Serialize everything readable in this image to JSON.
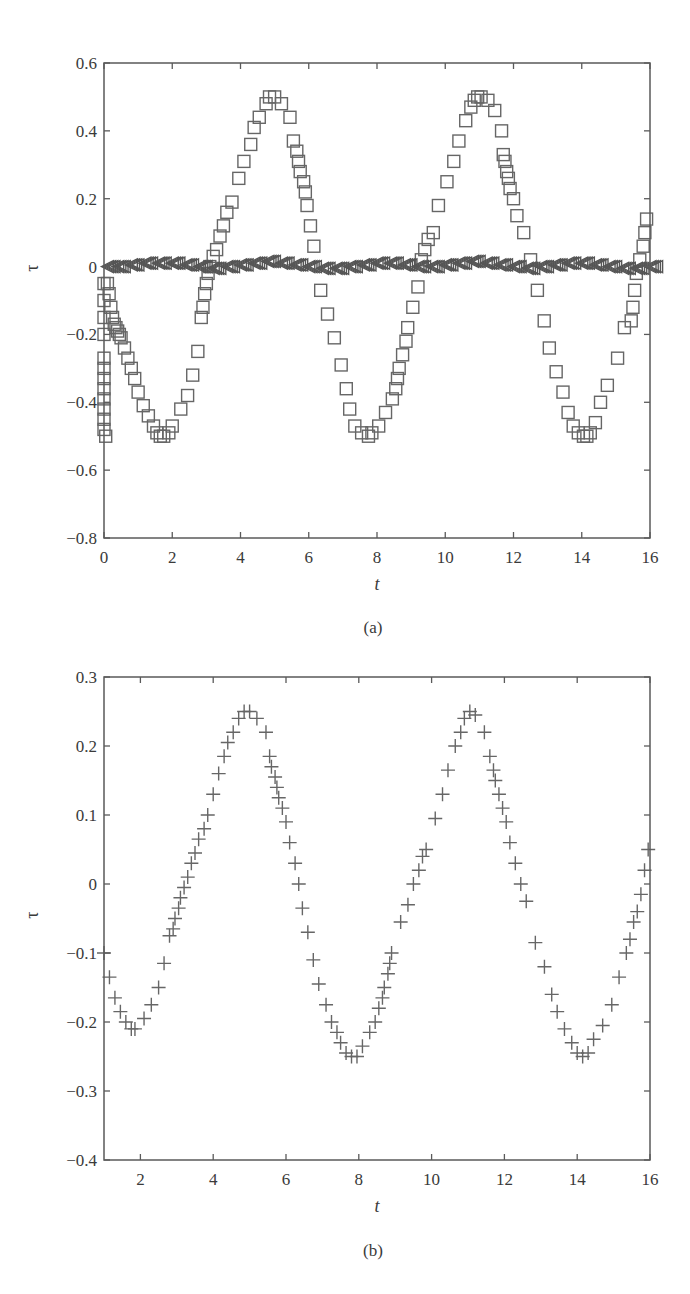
{
  "chart_data": [
    {
      "id": "a",
      "type": "scatter",
      "panel_label": "(a)",
      "title": "",
      "xlabel": "t",
      "ylabel": "τ",
      "xlim": [
        0,
        16
      ],
      "ylim": [
        -0.8,
        0.6
      ],
      "xticks": [
        0,
        2,
        4,
        6,
        8,
        10,
        12,
        14,
        16
      ],
      "xtick_labels": [
        "0",
        "2",
        "4",
        "6",
        "8",
        "10",
        "12",
        "14",
        "16"
      ],
      "yticks": [
        0.6,
        0.4,
        0.2,
        0,
        -0.2,
        -0.4,
        -0.6,
        -0.8
      ],
      "ytick_labels": [
        "0.6",
        "0.4",
        "0.2",
        "0",
        "−0.2",
        "−0.4",
        "−0.6",
        "−0.8"
      ],
      "grid": false,
      "legend": null,
      "series": [
        {
          "name": "squares",
          "marker": "square",
          "x": [
            0.0,
            0.0,
            0.0,
            0.0,
            0.0,
            0.0,
            0.0,
            0.0,
            0.0,
            0.0,
            0.0,
            0.0,
            0.05,
            0.1,
            0.15,
            0.2,
            0.25,
            0.3,
            0.35,
            0.4,
            0.45,
            0.5,
            0.6,
            0.7,
            0.8,
            0.9,
            1.0,
            1.15,
            1.3,
            1.45,
            1.55,
            1.65,
            1.75,
            1.9,
            2.0,
            2.25,
            2.45,
            2.6,
            2.75,
            2.85,
            2.9,
            2.95,
            3.0,
            3.05,
            3.1,
            3.2,
            3.3,
            3.4,
            3.5,
            3.6,
            3.75,
            3.95,
            4.1,
            4.3,
            4.4,
            4.55,
            4.75,
            4.85,
            5.0,
            5.2,
            5.45,
            5.55,
            5.65,
            5.7,
            5.75,
            5.85,
            5.9,
            5.95,
            6.05,
            6.15,
            6.35,
            6.55,
            6.75,
            6.95,
            7.1,
            7.2,
            7.35,
            7.55,
            7.75,
            7.85,
            8.05,
            8.25,
            8.45,
            8.55,
            8.6,
            8.65,
            8.75,
            8.85,
            8.9,
            9.05,
            9.2,
            9.3,
            9.4,
            9.5,
            9.65,
            9.8,
            10.05,
            10.25,
            10.4,
            10.6,
            10.75,
            10.85,
            10.95,
            11.05,
            11.25,
            11.45,
            11.65,
            11.7,
            11.75,
            11.8,
            11.85,
            11.9,
            12.0,
            12.1,
            12.3,
            12.5,
            12.7,
            12.9,
            13.05,
            13.25,
            13.45,
            13.6,
            13.75,
            13.9,
            14.05,
            14.15,
            14.25,
            14.4,
            14.55,
            14.75,
            15.05,
            15.25,
            15.45,
            15.5,
            15.55,
            15.6,
            15.7,
            15.8,
            15.85,
            15.9
          ],
          "y": [
            -0.05,
            -0.1,
            -0.15,
            -0.2,
            -0.27,
            -0.3,
            -0.33,
            -0.36,
            -0.39,
            -0.42,
            -0.45,
            -0.48,
            -0.5,
            -0.05,
            -0.08,
            -0.12,
            -0.15,
            -0.17,
            -0.18,
            -0.19,
            -0.2,
            -0.21,
            -0.24,
            -0.27,
            -0.3,
            -0.33,
            -0.37,
            -0.41,
            -0.44,
            -0.47,
            -0.49,
            -0.5,
            -0.5,
            -0.49,
            -0.47,
            -0.42,
            -0.38,
            -0.32,
            -0.25,
            -0.15,
            -0.12,
            -0.08,
            -0.05,
            -0.02,
            0.0,
            0.03,
            0.05,
            0.09,
            0.12,
            0.16,
            0.19,
            0.26,
            0.31,
            0.36,
            0.41,
            0.44,
            0.48,
            0.5,
            0.5,
            0.48,
            0.44,
            0.37,
            0.34,
            0.31,
            0.28,
            0.25,
            0.22,
            0.18,
            0.12,
            0.06,
            -0.07,
            -0.14,
            -0.21,
            -0.29,
            -0.36,
            -0.42,
            -0.47,
            -0.49,
            -0.5,
            -0.49,
            -0.47,
            -0.43,
            -0.39,
            -0.36,
            -0.33,
            -0.3,
            -0.26,
            -0.22,
            -0.18,
            -0.12,
            -0.06,
            0.02,
            0.05,
            0.08,
            0.1,
            0.18,
            0.25,
            0.31,
            0.37,
            0.43,
            0.47,
            0.49,
            0.5,
            0.5,
            0.49,
            0.46,
            0.4,
            0.33,
            0.31,
            0.28,
            0.26,
            0.23,
            0.2,
            0.15,
            0.1,
            0.02,
            -0.07,
            -0.16,
            -0.24,
            -0.31,
            -0.37,
            -0.43,
            -0.47,
            -0.49,
            -0.5,
            -0.5,
            -0.49,
            -0.46,
            -0.4,
            -0.35,
            -0.27,
            -0.18,
            -0.16,
            -0.12,
            -0.07,
            -0.02,
            0.02,
            0.06,
            0.1,
            0.14
          ]
        },
        {
          "name": "triangles",
          "marker": "triangle-left",
          "description": "dense band of triangle markers oscillating with small amplitude around τ=0 across t=0 to 16",
          "x": [
            0.1,
            0.4,
            0.8,
            1.2,
            1.6,
            2.0,
            2.4,
            2.8,
            3.2,
            3.6,
            4.0,
            4.4,
            4.8,
            5.2,
            5.6,
            6.0,
            6.4,
            6.8,
            7.2,
            7.6,
            8.0,
            8.4,
            8.8,
            9.2,
            9.6,
            10.0,
            10.4,
            10.8,
            11.2,
            11.6,
            12.0,
            12.4,
            12.8,
            13.2,
            13.6,
            14.0,
            14.4,
            14.8,
            15.2,
            15.6,
            16.0
          ],
          "y": [
            0.0,
            0.0,
            0.005,
            0.01,
            0.01,
            0.01,
            0.005,
            0.0,
            -0.005,
            0.0,
            0.005,
            0.01,
            0.015,
            0.01,
            0.005,
            0.0,
            -0.005,
            -0.005,
            0.0,
            0.005,
            0.01,
            0.01,
            0.005,
            0.0,
            0.0,
            0.005,
            0.01,
            0.015,
            0.01,
            0.005,
            0.0,
            -0.005,
            0.0,
            0.005,
            0.01,
            0.01,
            0.005,
            0.0,
            -0.005,
            -0.005,
            0.0
          ]
        }
      ]
    },
    {
      "id": "b",
      "type": "scatter",
      "panel_label": "(b)",
      "title": "",
      "xlabel": "t",
      "ylabel": "τ",
      "xlim": [
        1,
        16
      ],
      "ylim": [
        -0.4,
        0.3
      ],
      "xticks": [
        2,
        4,
        6,
        8,
        10,
        12,
        14,
        16
      ],
      "xtick_labels": [
        "2",
        "4",
        "6",
        "8",
        "10",
        "12",
        "14",
        "16"
      ],
      "yticks": [
        0.3,
        0.2,
        0.1,
        0,
        -0.1,
        -0.2,
        -0.3,
        -0.4
      ],
      "ytick_labels": [
        "0.3",
        "0.2",
        "0.1",
        "0",
        "−0.1",
        "−0.2",
        "−0.3",
        "−0.4"
      ],
      "grid": false,
      "legend": null,
      "series": [
        {
          "name": "plus",
          "marker": "plus",
          "x": [
            1.0,
            1.15,
            1.3,
            1.45,
            1.6,
            1.75,
            1.85,
            2.1,
            2.3,
            2.5,
            2.65,
            2.8,
            2.9,
            2.95,
            3.05,
            3.1,
            3.2,
            3.3,
            3.4,
            3.5,
            3.6,
            3.75,
            3.85,
            4.0,
            4.15,
            4.3,
            4.4,
            4.55,
            4.7,
            4.85,
            5.0,
            5.2,
            5.45,
            5.55,
            5.6,
            5.7,
            5.75,
            5.8,
            5.9,
            6.0,
            6.1,
            6.25,
            6.35,
            6.45,
            6.6,
            6.75,
            6.9,
            7.1,
            7.25,
            7.4,
            7.5,
            7.65,
            7.8,
            7.95,
            8.1,
            8.3,
            8.45,
            8.55,
            8.65,
            8.7,
            8.8,
            8.85,
            8.9,
            9.15,
            9.35,
            9.5,
            9.65,
            9.75,
            9.85,
            10.1,
            10.3,
            10.45,
            10.65,
            10.8,
            10.9,
            11.05,
            11.2,
            11.45,
            11.6,
            11.7,
            11.75,
            11.85,
            11.95,
            12.05,
            12.15,
            12.3,
            12.45,
            12.6,
            12.85,
            13.1,
            13.3,
            13.45,
            13.65,
            13.85,
            14.0,
            14.15,
            14.3,
            14.45,
            14.7,
            14.95,
            15.15,
            15.35,
            15.45,
            15.55,
            15.65,
            15.75,
            15.85,
            15.95
          ],
          "y": [
            -0.1,
            -0.135,
            -0.165,
            -0.185,
            -0.2,
            -0.21,
            -0.21,
            -0.195,
            -0.175,
            -0.15,
            -0.115,
            -0.075,
            -0.065,
            -0.05,
            -0.035,
            -0.02,
            -0.005,
            0.01,
            0.03,
            0.045,
            0.065,
            0.08,
            0.1,
            0.13,
            0.16,
            0.185,
            0.205,
            0.22,
            0.24,
            0.25,
            0.25,
            0.24,
            0.22,
            0.185,
            0.17,
            0.155,
            0.14,
            0.125,
            0.11,
            0.09,
            0.06,
            0.03,
            0.0,
            -0.035,
            -0.07,
            -0.11,
            -0.145,
            -0.175,
            -0.2,
            -0.215,
            -0.23,
            -0.245,
            -0.25,
            -0.25,
            -0.235,
            -0.215,
            -0.2,
            -0.18,
            -0.165,
            -0.15,
            -0.13,
            -0.115,
            -0.1,
            -0.055,
            -0.03,
            0.0,
            0.02,
            0.04,
            0.05,
            0.095,
            0.13,
            0.165,
            0.2,
            0.22,
            0.24,
            0.25,
            0.245,
            0.22,
            0.185,
            0.165,
            0.15,
            0.13,
            0.11,
            0.09,
            0.06,
            0.03,
            0.0,
            -0.025,
            -0.085,
            -0.12,
            -0.16,
            -0.185,
            -0.21,
            -0.23,
            -0.245,
            -0.25,
            -0.245,
            -0.225,
            -0.205,
            -0.175,
            -0.135,
            -0.1,
            -0.08,
            -0.055,
            -0.04,
            -0.015,
            0.02,
            0.05
          ]
        }
      ]
    }
  ]
}
